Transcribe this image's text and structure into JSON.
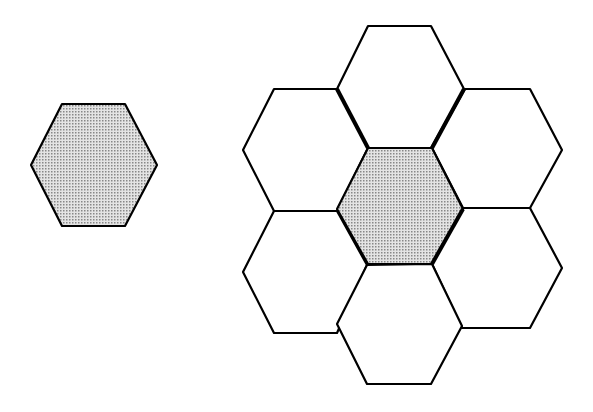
{
  "diagram": {
    "colors": {
      "stroke": "#000000",
      "shaded_fill": "#c8c8c8",
      "background": "#ffffff"
    },
    "single_hexagon": {
      "shaded": true,
      "points": "31,165 62,104 125,104 157,165 125,226 62,226"
    },
    "cluster": [
      {
        "id": "top",
        "shaded": false,
        "points": "368,26 431,26 464,89 431,148 368,148 337,89"
      },
      {
        "id": "upper-left",
        "shaded": false,
        "points": "274,89 337,89 368,148 337,211 274,211 243,150"
      },
      {
        "id": "upper-right",
        "shaded": false,
        "points": "465,89 530,89 562,150 530,208 463,208 432,148"
      },
      {
        "id": "lower-left",
        "shaded": false,
        "points": "274,211 337,211 367,265 337,333 274,333 243,272"
      },
      {
        "id": "lower-right",
        "shaded": false,
        "points": "463,208 530,208 562,268 530,328 462,328 432,264"
      },
      {
        "id": "bottom",
        "shaded": false,
        "points": "367,265 432,264 462,326 431,384 367,384 337,324"
      },
      {
        "id": "center",
        "shaded": true,
        "points": "368,148 432,148 463,209 432,264 368,264 337,209"
      }
    ]
  }
}
